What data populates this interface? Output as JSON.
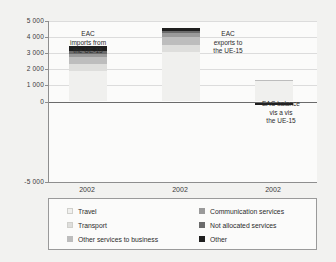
{
  "chart_data": {
    "type": "bar",
    "title": "",
    "subtitle": "",
    "xlabel": "",
    "ylabel": "",
    "stacked": true,
    "grid": true,
    "legend_position": "bottom",
    "ylim": [
      -5000,
      5000
    ],
    "yticks": [
      {
        "value": 5000,
        "label": "5 000"
      },
      {
        "value": 4000,
        "label": "4 000"
      },
      {
        "value": 3000,
        "label": "3 000"
      },
      {
        "value": 2000,
        "label": "2 000"
      },
      {
        "value": 1000,
        "label": "1 000"
      },
      {
        "value": 0,
        "label": "0"
      },
      {
        "value": -5000,
        "label": "-5 000"
      }
    ],
    "categories": [
      "2002",
      "2002",
      "2002"
    ],
    "group_labels": [
      "EAC imports from the UE-15",
      "EAC exports to the UE-15",
      "EAC balance vis a vis the UE-15"
    ],
    "series": [
      {
        "name": "Travel",
        "color": "#f0f0ee",
        "values": [
          1870,
          3100,
          1290
        ]
      },
      {
        "name": "Transport",
        "color": "#dededc",
        "values": [
          440,
          400,
          -60
        ]
      },
      {
        "name": "Other services to business",
        "color": "#bdbdbd",
        "values": [
          440,
          480,
          40
        ]
      },
      {
        "name": "Communication services",
        "color": "#9a9a9a",
        "values": [
          230,
          250,
          20
        ]
      },
      {
        "name": "Not allocated services",
        "color": "#6b6b6b",
        "values": [
          180,
          170,
          -10
        ]
      },
      {
        "name": "Other",
        "color": "#1f1f1f",
        "values": [
          300,
          160,
          -140
        ]
      }
    ],
    "bar_totals": [
      3460,
      4560,
      1400
    ],
    "negative_totals": [
      0,
      0,
      -310
    ]
  },
  "annotations": [
    {
      "id": "annot-imports",
      "lines": [
        "EAC",
        "imports from",
        "the UE-15"
      ]
    },
    {
      "id": "annot-exports",
      "lines": [
        "EAC",
        "exports to",
        "the UE-15"
      ]
    },
    {
      "id": "annot-balance",
      "lines": [
        "EAC balance",
        "vis a vis",
        "the UE-15"
      ]
    }
  ],
  "legend": {
    "left_column": [
      {
        "label": "Travel",
        "color": "#f0f0ee"
      },
      {
        "label": "Transport",
        "color": "#dededc"
      },
      {
        "label": "Other services to business",
        "color": "#bdbdbd"
      }
    ],
    "right_column": [
      {
        "label": "Communication services",
        "color": "#9a9a9a"
      },
      {
        "label": "Not allocated services",
        "color": "#6b6b6b"
      },
      {
        "label": "Other",
        "color": "#1f1f1f"
      }
    ]
  }
}
